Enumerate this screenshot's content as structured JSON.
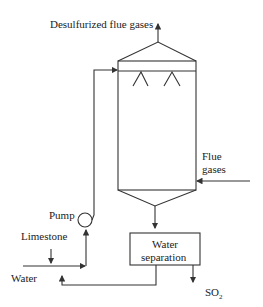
{
  "diagram": {
    "labels": {
      "outlet": "Desulfurized flue gases",
      "inlet_line1": "Flue",
      "inlet_line2": "gases",
      "pump": "Pump",
      "limestone": "Limestone",
      "water": "Water",
      "separator_line1": "Water",
      "separator_line2": "separation",
      "so2": "SO",
      "so2_sub": "2"
    },
    "colors": {
      "line": "#333333",
      "text": "#222222",
      "background": "#ffffff"
    }
  }
}
